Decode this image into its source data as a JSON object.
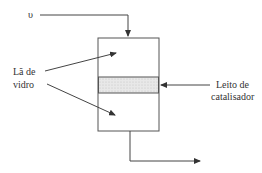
{
  "diagram": {
    "inlet_symbol": "υ",
    "glass_wool_label_line1": "Lã de",
    "glass_wool_label_line2": "vidro",
    "bed_label_line1": "Leito de",
    "bed_label_line2": "catalisador",
    "colors": {
      "line": "#444444",
      "bed_fill": "#e6e6e6"
    }
  }
}
